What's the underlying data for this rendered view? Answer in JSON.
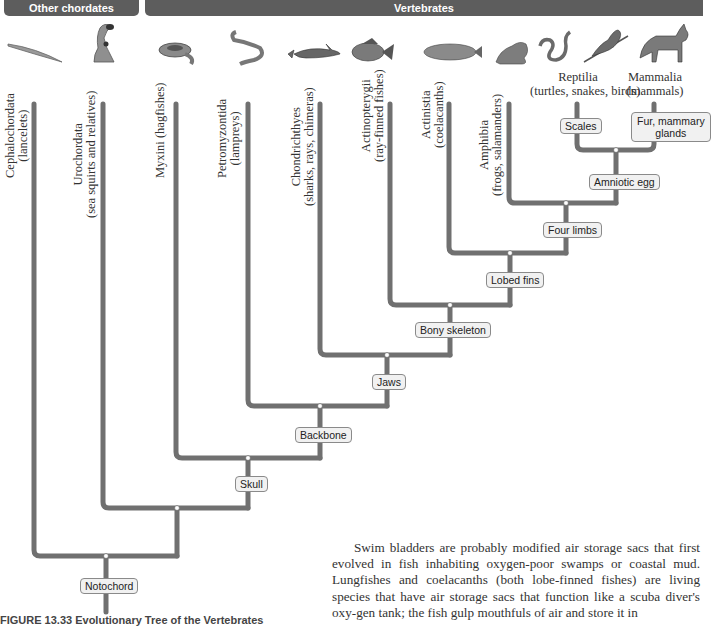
{
  "headers": {
    "other_chordates": "Other chordates",
    "vertebrates": "Vertebrates"
  },
  "organisms": [
    {
      "name": "lancelet-icon"
    },
    {
      "name": "sea-squirt-icon"
    },
    {
      "name": "hagfish-icon"
    },
    {
      "name": "lamprey-icon"
    },
    {
      "name": "shark-icon"
    },
    {
      "name": "ray-finned-fish-icon"
    },
    {
      "name": "coelacanth-icon"
    },
    {
      "name": "frog-icon"
    },
    {
      "name": "snake-icon"
    },
    {
      "name": "bird-icon"
    },
    {
      "name": "fox-icon"
    }
  ],
  "taxa": [
    {
      "name": "Cephalochordata",
      "common": "(lancelets)"
    },
    {
      "name": "Urochordata",
      "common": "(sea squirts and relatives)"
    },
    {
      "name": "Myxini (hagfishes)",
      "common": ""
    },
    {
      "name": "Petromyzontida",
      "common": "(lampreys)"
    },
    {
      "name": "Chondrichthyes",
      "common": "(sharks, rays, chimeras)"
    },
    {
      "name": "Actinopterygii",
      "common": "(ray-finned fishes)"
    },
    {
      "name": "Actinistia",
      "common": "(coelacanths)"
    },
    {
      "name": "Amphibia",
      "common": "(frogs, salamanders)"
    },
    {
      "name": "Reptilia",
      "common": "(turtles, snakes, birds)"
    },
    {
      "name": "Mammalia",
      "common": "(mammals)"
    }
  ],
  "traits": {
    "scales": "Scales",
    "fur": "Fur, mammary glands",
    "fur_line1": "Fur, mammary",
    "fur_line2": "glands",
    "amniotic_egg": "Amniotic egg",
    "four_limbs": "Four limbs",
    "lobed_fins": "Lobed fins",
    "bony_skeleton": "Bony skeleton",
    "jaws": "Jaws",
    "backbone": "Backbone",
    "skull": "Skull",
    "notochord": "Notochord"
  },
  "colors": {
    "header_bg": "#5d5d5d",
    "branch": "#707070",
    "node": "#ffffff",
    "trait_bg": "#f1f1f1"
  },
  "caption": "FIGURE 13.33 Evolutionary Tree of the Vertebrates",
  "body_text": {
    "paragraph": "Swim bladders are probably modified air storage sacs that first evolved in fish inhabiting oxygen-poor swamps or coastal mud. Lungfishes and coelacanths (both lobe-finned fishes) are living species that have air storage sacs that function like a scuba diver's oxy-gen tank; the fish gulp mouthfuls of air and store it in"
  }
}
